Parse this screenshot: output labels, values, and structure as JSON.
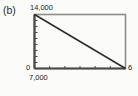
{
  "figure": {
    "panel_label": "(b)"
  },
  "chart_data": {
    "type": "line",
    "title": "(b)",
    "xlabel": "",
    "ylabel": "",
    "grid": false,
    "legend": null,
    "xlim": [
      7000,
      6
    ],
    "ylim": [
      0,
      14000
    ],
    "x_tick_labels": [
      "7,000",
      "6"
    ],
    "y_tick_labels": [
      "0",
      "14,000"
    ],
    "x_tick_count": 5,
    "y_tick_count": 9,
    "series": [
      {
        "name": "line",
        "x": [
          7000,
          6
        ],
        "values": [
          14000,
          0
        ],
        "color": "#2a2a2a"
      }
    ],
    "frame_color": "#8c8c8c",
    "axis_color": "#4a4a4a"
  },
  "axes": {
    "y_max_label": "14,000",
    "y_min_label": "0",
    "x_min_label": "7,000",
    "x_max_label": "6"
  }
}
